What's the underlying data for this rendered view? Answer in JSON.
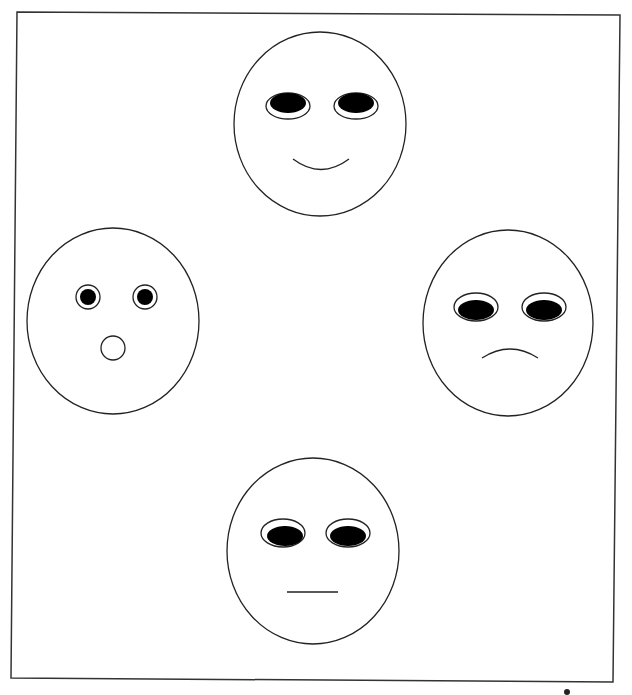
{
  "canvas": {
    "width": 632,
    "height": 695,
    "background": "#ffffff",
    "stroke": "#222222",
    "fill_dark": "#000000"
  },
  "frame": {
    "points": "17,12 620,15 613,682 11,678"
  },
  "faces": [
    {
      "name": "happy",
      "cx": 320,
      "cy": 124,
      "rx": 86,
      "ry": 92,
      "eyes": [
        {
          "cx": 288,
          "cy": 106,
          "orx": 22,
          "ory": 13,
          "pcx": 288,
          "pcy": 103,
          "prx": 18,
          "pry": 10
        },
        {
          "cx": 356,
          "cy": 106,
          "orx": 22,
          "ory": 13,
          "pcx": 356,
          "pcy": 103,
          "prx": 18,
          "pry": 10
        }
      ],
      "mouth": "M293,159 Q321,180 349,159"
    },
    {
      "name": "surprised",
      "cx": 113,
      "cy": 321,
      "rx": 86,
      "ry": 93,
      "eyes": [
        {
          "cx": 88,
          "cy": 297,
          "orx": 12,
          "ory": 12,
          "pcx": 88,
          "pcy": 297,
          "prx": 8,
          "pry": 8
        },
        {
          "cx": 145,
          "cy": 297,
          "orx": 12,
          "ory": 12,
          "pcx": 145,
          "pcy": 297,
          "prx": 8,
          "pry": 8
        }
      ],
      "mouth_circle": {
        "cx": 113,
        "cy": 348,
        "r": 12
      }
    },
    {
      "name": "sad",
      "cx": 508,
      "cy": 323,
      "rx": 85,
      "ry": 93,
      "eyes": [
        {
          "cx": 476,
          "cy": 307,
          "orx": 22,
          "ory": 14,
          "pcx": 476,
          "pcy": 310,
          "prx": 18,
          "pry": 10
        },
        {
          "cx": 544,
          "cy": 307,
          "orx": 22,
          "ory": 14,
          "pcx": 544,
          "pcy": 310,
          "prx": 18,
          "pry": 10
        }
      ],
      "mouth": "M482,358 Q510,340 538,358"
    },
    {
      "name": "neutral",
      "cx": 313,
      "cy": 551,
      "rx": 86,
      "ry": 93,
      "eyes": [
        {
          "cx": 283,
          "cy": 533,
          "orx": 22,
          "ory": 14,
          "pcx": 285,
          "pcy": 536,
          "prx": 18,
          "pry": 10
        },
        {
          "cx": 348,
          "cy": 533,
          "orx": 22,
          "ory": 14,
          "pcx": 348,
          "pcy": 536,
          "prx": 18,
          "pry": 10
        }
      ],
      "mouth_line": {
        "x1": 287,
        "y1": 592,
        "x2": 338,
        "y2": 592
      }
    }
  ],
  "cursor": {
    "cx": 567,
    "cy": 692,
    "r": 3
  }
}
